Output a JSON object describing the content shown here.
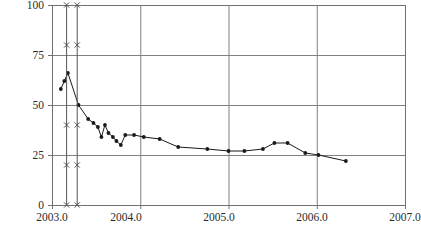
{
  "chart_data": {
    "type": "line",
    "title": "",
    "title_note": "title row is cropped off the top edge of the screenshot",
    "xlabel": "",
    "ylabel": "",
    "xlim": [
      2003.0,
      2007.0
    ],
    "ylim": [
      0,
      100
    ],
    "x_ticks": [
      2003.0,
      2004.0,
      2005.0,
      2006.0,
      2007.0
    ],
    "x_tick_labels": [
      "2003.0",
      "2004.0",
      "2005.0",
      "2006.0",
      "2007.0"
    ],
    "y_ticks": [
      0,
      25,
      50,
      75,
      100
    ],
    "y_tick_labels": [
      "0",
      "25",
      "50",
      "75",
      "100"
    ],
    "grid": true,
    "grid_color": "#808080",
    "legend": "none",
    "series": [
      {
        "name": "main-series",
        "marker": "filled-circle",
        "color": "#1a1a1a",
        "points": [
          [
            2003.1,
            58
          ],
          [
            2003.14,
            62
          ],
          [
            2003.18,
            66
          ],
          [
            2003.3,
            50
          ],
          [
            2003.41,
            43
          ],
          [
            2003.47,
            41
          ],
          [
            2003.52,
            39
          ],
          [
            2003.56,
            34
          ],
          [
            2003.6,
            40
          ],
          [
            2003.64,
            36
          ],
          [
            2003.69,
            34
          ],
          [
            2003.73,
            32
          ],
          [
            2003.78,
            30
          ],
          [
            2003.83,
            35
          ],
          [
            2003.93,
            35
          ],
          [
            2004.04,
            34
          ],
          [
            2004.22,
            33
          ],
          [
            2004.43,
            29
          ],
          [
            2004.76,
            28
          ],
          [
            2005.0,
            27
          ],
          [
            2005.18,
            27
          ],
          [
            2005.39,
            28
          ],
          [
            2005.52,
            31
          ],
          [
            2005.67,
            31
          ],
          [
            2005.87,
            26
          ],
          [
            2006.02,
            25
          ],
          [
            2006.33,
            22
          ]
        ]
      },
      {
        "name": "reference-line-1",
        "marker": "x",
        "color": "#555555",
        "x": 2003.16,
        "marker_values": [
          100,
          80,
          40,
          20,
          0
        ]
      },
      {
        "name": "reference-line-2",
        "marker": "x",
        "color": "#555555",
        "x": 2003.28,
        "marker_values": [
          100,
          80,
          40,
          20,
          0
        ]
      }
    ]
  },
  "axes": {
    "frame_color": "#707070",
    "plot_left": 52,
    "plot_right": 405,
    "plot_top": 5,
    "plot_bottom": 205
  }
}
